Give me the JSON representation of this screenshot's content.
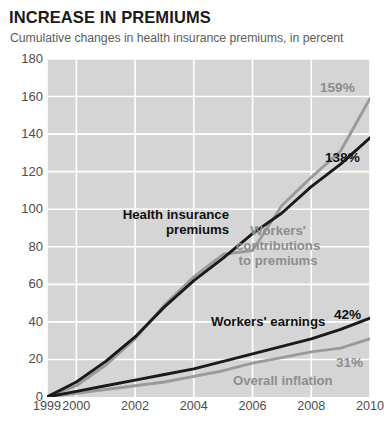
{
  "header": {
    "title": "INCREASE IN PREMIUMS",
    "subtitle": "Cumulative changes in health insurance premiums, in percent"
  },
  "colors": {
    "dark_series": "#1a1a1a",
    "gray_series": "#9a9a9a",
    "plot_background": "#d5d5d5",
    "gridline": "#ffffff",
    "title_text": "#1b1b1b",
    "subtitle_text": "#5d5d5d",
    "tick_text": "#4c4c4c",
    "label_gray": "#8d8d8d"
  },
  "annotations": {
    "health_insurance_premiums": "Health insurance\npremiums",
    "workers_contributions": "Workers'\ncontributions\nto premiums",
    "workers_earnings": "Workers' earnings",
    "overall_inflation": "Overall inflation",
    "end_value_contributions": "159%",
    "end_value_premiums": "138%",
    "end_value_earnings": "42%",
    "end_value_inflation": "31%"
  },
  "chart_data": {
    "type": "line",
    "title": "INCREASE IN PREMIUMS",
    "subtitle": "Cumulative changes in health insurance premiums, in percent",
    "xlabel": "",
    "ylabel": "",
    "ylim": [
      0,
      180
    ],
    "xlim": [
      1999,
      2010
    ],
    "yticks": [
      0,
      20,
      40,
      60,
      80,
      100,
      120,
      140,
      160,
      180
    ],
    "ytick_labels": [
      "0",
      "20",
      "40",
      "60",
      "80",
      "100",
      "120",
      "140",
      "160",
      "180"
    ],
    "xticks": [
      1999,
      2000,
      2002,
      2004,
      2006,
      2008,
      2010
    ],
    "xtick_labels": [
      "1999",
      "2000",
      "2002",
      "2004",
      "2006",
      "2008",
      "2010"
    ],
    "grid": true,
    "legend": "none (inline labels)",
    "x": [
      1999,
      2000,
      2001,
      2002,
      2003,
      2004,
      2005,
      2006,
      2007,
      2008,
      2009,
      2010
    ],
    "series": [
      {
        "name": "Health insurance premiums",
        "color": "#1a1a1a",
        "end_label": "138%",
        "values": [
          0,
          8,
          19,
          32,
          48,
          62,
          74,
          87,
          98,
          112,
          124,
          138
        ]
      },
      {
        "name": "Workers' contributions to premiums",
        "color": "#9a9a9a",
        "end_label": "159%",
        "values": [
          0,
          6,
          17,
          31,
          49,
          64,
          76,
          78,
          102,
          117,
          131,
          159
        ]
      },
      {
        "name": "Workers' earnings",
        "color": "#1a1a1a",
        "end_label": "42%",
        "values": [
          0,
          3,
          6,
          9,
          12,
          15,
          19,
          23,
          27,
          31,
          36,
          42
        ]
      },
      {
        "name": "Overall inflation",
        "color": "#9a9a9a",
        "end_label": "31%",
        "values": [
          0,
          2,
          4,
          6,
          8,
          11,
          14,
          18,
          21,
          24,
          26,
          31
        ]
      }
    ]
  }
}
